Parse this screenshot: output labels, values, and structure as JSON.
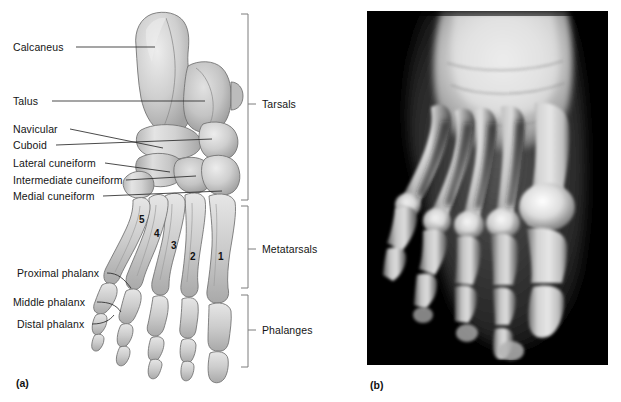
{
  "figure": {
    "panel_a_caption": "(a)",
    "panel_b_caption": "(b)"
  },
  "panel_a": {
    "type": "illustration",
    "description": "superior view drawing of the bones of the right foot",
    "labels": [
      {
        "name": "calcaneus",
        "text": "Calcaneus"
      },
      {
        "name": "talus",
        "text": "Talus"
      },
      {
        "name": "navicular",
        "text": "Navicular"
      },
      {
        "name": "cuboid",
        "text": "Cuboid"
      },
      {
        "name": "lateral-cuneiform",
        "text": "Lateral cuneiform"
      },
      {
        "name": "intermediate-cuneiform",
        "text": "Intermediate cuneiform"
      },
      {
        "name": "medial-cuneiform",
        "text": "Medial cuneiform"
      },
      {
        "name": "proximal-phalanx",
        "text": "Proximal phalanx"
      },
      {
        "name": "middle-phalanx",
        "text": "Middle phalanx"
      },
      {
        "name": "distal-phalanx",
        "text": "Distal phalanx"
      }
    ],
    "metatarsal_numbers": [
      "1",
      "2",
      "3",
      "4",
      "5"
    ],
    "group_brackets": [
      {
        "name": "tarsals",
        "text": "Tarsals"
      },
      {
        "name": "metatarsals",
        "text": "Metatarsals"
      },
      {
        "name": "phalanges",
        "text": "Phalanges"
      }
    ]
  },
  "panel_b": {
    "type": "radiograph",
    "description": "x-ray photograph of a foot, anterior-posterior view",
    "background_color": "#000000"
  },
  "colors": {
    "page_background": "#ffffff",
    "text": "#141414",
    "leader_line": "#2b2b2b",
    "bracket": "#7d7d7d",
    "bone_light": "#e9e9e9",
    "bone_mid": "#c3c3c3",
    "bone_shadow": "#9a9a9a",
    "bone_outline": "#6f6f6f",
    "xray_background": "#000000"
  }
}
